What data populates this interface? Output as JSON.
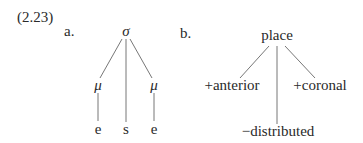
{
  "example_number": "(2.23)",
  "tree_a": {
    "label": "a.",
    "root": "σ",
    "mora_left": "μ",
    "mora_right": "μ",
    "segments": [
      "e",
      "s",
      "e"
    ]
  },
  "tree_b": {
    "label": "b.",
    "root": "place",
    "children": [
      "+anterior",
      "−distributed",
      "+coronal"
    ]
  }
}
